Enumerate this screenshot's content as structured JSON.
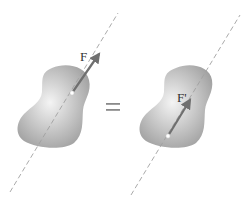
{
  "figure": {
    "left_panel": {
      "force_label": "F",
      "body": "rigid-body",
      "line_of_action": "dashed"
    },
    "equals_symbol": "=",
    "right_panel": {
      "force_label": "F'",
      "body": "rigid-body",
      "line_of_action": "dashed"
    },
    "colors": {
      "body_fill_light": "#f2f2f2",
      "body_fill_dark": "#9a9a9a",
      "arrow": "#6f6f6f",
      "line_of_action": "#9a9a9a",
      "text": "#333333"
    }
  }
}
